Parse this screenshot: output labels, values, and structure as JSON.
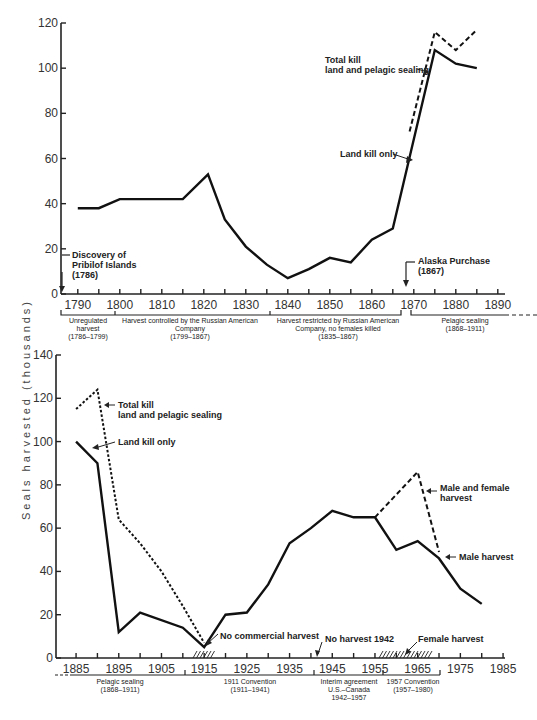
{
  "chart_data": [
    {
      "type": "line",
      "title": "",
      "xlabel": "",
      "ylabel": "Seals harvested (thousands)",
      "xlim": [
        1786,
        1890
      ],
      "ylim": [
        0,
        120
      ],
      "x_ticks": [
        "1790",
        "1800",
        "1810",
        "1820",
        "1830",
        "1840",
        "1850",
        "1860",
        "1870",
        "1880",
        "1890"
      ],
      "y_ticks": [
        "0",
        "20",
        "40",
        "60",
        "80",
        "100",
        "120"
      ],
      "series": [
        {
          "name": "Land kill only",
          "style": "solid",
          "x": [
            1790,
            1795,
            1800,
            1815,
            1821,
            1825,
            1830,
            1835,
            1840,
            1845,
            1850,
            1855,
            1860,
            1865,
            1875,
            1880,
            1885
          ],
          "values": [
            38,
            38,
            42,
            42,
            53,
            33,
            21,
            13,
            7,
            11,
            16,
            14,
            24,
            29,
            108,
            102,
            100
          ]
        },
        {
          "name": "Total kill land and pelagic sealing",
          "style": "dashed",
          "x": [
            1869,
            1875,
            1880,
            1885
          ],
          "values": [
            72,
            116,
            108,
            117
          ]
        }
      ],
      "annotations": [
        {
          "text": "Discovery of\nPribilof Islands\n(1786)",
          "x": 1786
        },
        {
          "text": "Alaska Purchase\n(1867)",
          "x": 1867
        },
        {
          "text": "Total kill\nland and pelagic sealing"
        },
        {
          "text": "Land kill only"
        }
      ],
      "periods": [
        {
          "label": "Unregulated\nharvest\n(1786–1799)",
          "start": 1786,
          "end": 1799
        },
        {
          "label": "Harvest controlled by the Russian American\nCompany\n(1799–1867)",
          "start": 1799,
          "end": 1835
        },
        {
          "label": "Harvest restricted by Russian American\nCompany, no females killed\n(1835–1867)",
          "start": 1835,
          "end": 1867
        },
        {
          "label": "Pelagic sealing\n(1868–1911)",
          "start": 1868,
          "end": 1911
        }
      ],
      "grid": false
    },
    {
      "type": "line",
      "title": "",
      "xlabel": "",
      "ylabel": "Seals harvested (thousands)",
      "xlim": [
        1881,
        1985
      ],
      "ylim": [
        0,
        140
      ],
      "x_ticks": [
        "1885",
        "1895",
        "1905",
        "1915",
        "1925",
        "1935",
        "1945",
        "1955",
        "1965",
        "1975",
        "1985"
      ],
      "y_ticks": [
        "0",
        "20",
        "40",
        "60",
        "80",
        "100",
        "120",
        "140"
      ],
      "series": [
        {
          "name": "Land kill only / Male harvest",
          "style": "solid",
          "x": [
            1885,
            1890,
            1895,
            1900,
            1910,
            1915,
            1920,
            1925,
            1930,
            1935,
            1940,
            1945,
            1950,
            1955,
            1960,
            1965,
            1970,
            1975,
            1980
          ],
          "values": [
            100,
            90,
            12,
            21,
            14,
            5,
            20,
            21,
            34,
            53,
            60,
            68,
            65,
            65,
            50,
            54,
            46,
            32,
            25
          ]
        },
        {
          "name": "Total kill land and pelagic sealing",
          "style": "dotted",
          "x": [
            1885,
            1890,
            1895,
            1900,
            1905,
            1910,
            1915
          ],
          "values": [
            115,
            124,
            64,
            53,
            40,
            24,
            7
          ]
        },
        {
          "name": "Male and female harvest",
          "style": "dashed",
          "x": [
            1955,
            1965,
            1970
          ],
          "values": [
            65,
            86,
            49
          ]
        }
      ],
      "annotations": [
        {
          "text": "Total kill\nland and pelagic sealing"
        },
        {
          "text": "Land kill only"
        },
        {
          "text": "No commercial harvest",
          "x": 1915
        },
        {
          "text": "No harvest 1942",
          "x": 1942
        },
        {
          "text": "Female harvest",
          "x": 1960
        },
        {
          "text": "Male and female\nharvest"
        },
        {
          "text": "Male harvest"
        }
      ],
      "periods": [
        {
          "label": "Pelagic sealing\n(1868–1911)",
          "start": 1868,
          "end": 1911
        },
        {
          "label": "1911 Convention\n(1911–1941)",
          "start": 1911,
          "end": 1941
        },
        {
          "label": "Interim agreement\nU.S.–Canada\n1942–1957",
          "start": 1942,
          "end": 1957
        },
        {
          "label": "1957 Convention\n(1957–1980)",
          "start": 1957,
          "end": 1980
        }
      ],
      "grid": false
    }
  ],
  "labels": {
    "ylabel": "Seals harvested (thousands)",
    "top": {
      "discovery": [
        "Discovery of",
        "Pribilof Islands",
        "(1786)"
      ],
      "alaska": [
        "Alaska Purchase",
        "(1867)"
      ],
      "total": [
        "Total kill",
        "land and pelagic sealing"
      ],
      "land": "Land kill only",
      "p1": [
        "Unregulated",
        "harvest",
        "(1786–1799)"
      ],
      "p2": [
        "Harvest controlled by the Russian American",
        "Company",
        "(1799–1867)"
      ],
      "p3": [
        "Harvest restricted by Russian American",
        "Company, no females killed",
        "(1835–1867)"
      ],
      "p4": [
        "Pelagic sealing",
        "(1868–1911)"
      ]
    },
    "bottom": {
      "total": [
        "Total kill",
        "land and pelagic sealing"
      ],
      "land": "Land kill only",
      "nocomm": "No commercial harvest",
      "no1942": "No harvest 1942",
      "female": "Female harvest",
      "mf": [
        "Male and female",
        "harvest"
      ],
      "male": "Male harvest",
      "p1": [
        "Pelagic sealing",
        "(1868–1911)"
      ],
      "p2": [
        "1911 Convention",
        "(1911–1941)"
      ],
      "p3": [
        "Interim agreement",
        "U.S.–Canada",
        "1942–1957"
      ],
      "p4": [
        "1957 Convention",
        "(1957–1980)"
      ]
    }
  }
}
